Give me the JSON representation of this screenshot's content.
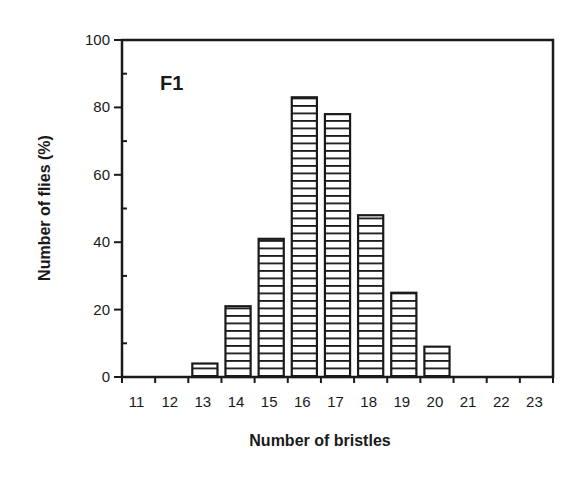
{
  "chart_data": {
    "type": "bar",
    "title": "",
    "panel_label": "F1",
    "xlabel": "Number of bristles",
    "ylabel": "Number of flies (%)",
    "categories": [
      "11",
      "12",
      "13",
      "14",
      "15",
      "16",
      "17",
      "18",
      "19",
      "20",
      "21",
      "22",
      "23"
    ],
    "values": [
      0,
      0,
      4,
      21,
      41,
      83,
      78,
      48,
      25,
      9,
      0,
      0,
      0
    ],
    "ylim": [
      0,
      100
    ],
    "yticks": [
      0,
      20,
      40,
      60,
      80,
      100
    ],
    "y_minor_step": 10,
    "grid": false,
    "legend": null,
    "bar_fill": "horizontal-hatch",
    "colors": {
      "ink": "#1a1a1a",
      "background": "#ffffff"
    }
  }
}
